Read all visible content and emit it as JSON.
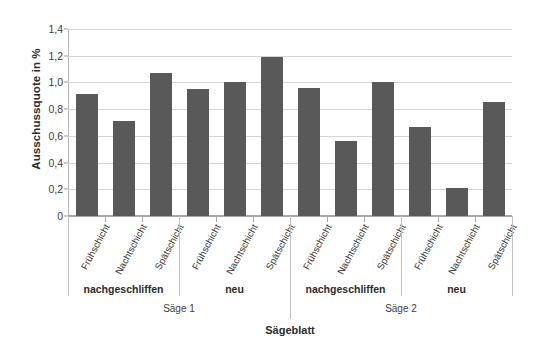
{
  "chart_data": {
    "type": "bar",
    "title": "",
    "xlabel": "Sägeblatt",
    "ylabel": "Ausschussquote in %",
    "ylim": [
      0,
      1.4
    ],
    "ytick_step": 0.2,
    "ytick_labels": [
      "1,4",
      "1,2",
      "1,0",
      "0,8",
      "0,6",
      "0,4",
      "0,2",
      "0"
    ],
    "ytick_values": [
      1.4,
      1.2,
      1.0,
      0.8,
      0.6,
      0.4,
      0.2,
      0
    ],
    "grid": true,
    "legend": "none",
    "bar_color": "#595959",
    "plot_bg": "#ffffff",
    "gridline_color": "#d4d4d4",
    "categories": [
      "Frühschicht",
      "Nachtschicht",
      "Spätschicht",
      "Frühschicht",
      "Nachtschicht",
      "Spätschicht",
      "Frühschicht",
      "Nachtschicht",
      "Spätschicht",
      "Frühschicht",
      "Nachtschicht",
      "Spätschicht"
    ],
    "values": [
      0.91,
      0.71,
      1.07,
      0.95,
      1.0,
      1.19,
      0.96,
      0.56,
      1.0,
      0.67,
      0.21,
      0.85
    ],
    "group_level_1": [
      {
        "label": "nachgeschliffen",
        "from": 0,
        "to": 2
      },
      {
        "label": "neu",
        "from": 3,
        "to": 5
      },
      {
        "label": "nachgeschliffen",
        "from": 6,
        "to": 8
      },
      {
        "label": "neu",
        "from": 9,
        "to": 11
      }
    ],
    "group_level_2": [
      {
        "label": "Säge 1",
        "from": 0,
        "to": 5
      },
      {
        "label": "Säge 2",
        "from": 6,
        "to": 11
      }
    ]
  }
}
